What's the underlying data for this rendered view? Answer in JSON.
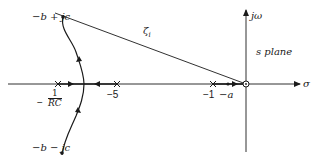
{
  "diagram": {
    "type": "root-locus",
    "plane_label": "s plane",
    "axes": {
      "real_axis_label": "σ",
      "imag_axis_label": "jω"
    },
    "poles": [
      {
        "label_minus": "−",
        "label_num": "1",
        "label_den": "RC",
        "kind": "pole"
      },
      {
        "label": "−5",
        "kind": "pole"
      },
      {
        "label": "−1",
        "kind": "pole"
      }
    ],
    "zero": {
      "label": "−a",
      "kind": "zero-at-origin-and-marker"
    },
    "points": {
      "upper": "−b + jc",
      "lower": "−b − jc"
    },
    "damping_line_label": "ζ",
    "damping_line_subscript": "i"
  },
  "colors": {
    "ink": "#1a1a1a",
    "background": "#ffffff"
  }
}
